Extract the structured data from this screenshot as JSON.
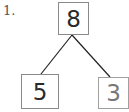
{
  "problem_number": "1.",
  "tree": {
    "root": {
      "value": "8"
    },
    "left_child": {
      "value": "5"
    },
    "right_child": {
      "value": "3"
    }
  },
  "colors": {
    "line": "#222222",
    "box_border": "#8a8a8a",
    "text": "#2a2a2a",
    "faded_text": "#777777"
  }
}
